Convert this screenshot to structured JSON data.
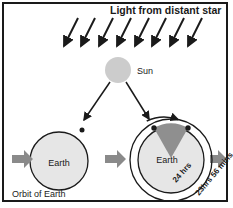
{
  "title": "Light from distant star",
  "sun": {
    "label": "Sun",
    "color": "#cccccc"
  },
  "earth_left": {
    "label": "Earth"
  },
  "earth_right": {
    "label": "Earth",
    "solar_day": "24 hrs",
    "sidereal_day": "23hrs 56 mins"
  },
  "orbit_label": "Orbit of Earth",
  "colors": {
    "earth_fill": "#e6e6e6",
    "wedge": "#8f8f8f",
    "arrow_gray": "#8a8a8a",
    "ink": "#1a1a1a"
  },
  "star_rays": 8
}
